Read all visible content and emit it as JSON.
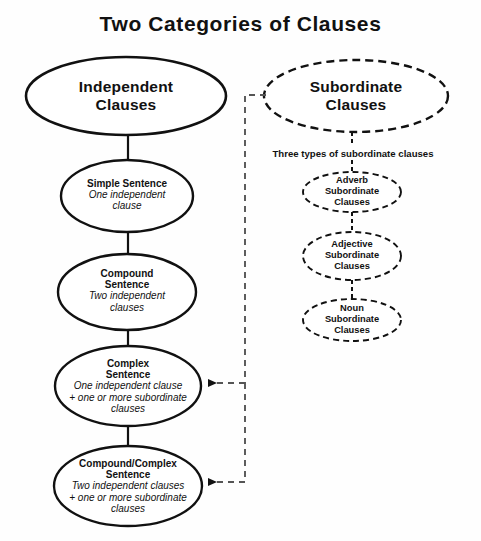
{
  "page": {
    "title": "Two Categories of Clauses",
    "background_color": "#fefefe",
    "line_color": "#111111"
  },
  "left_branch": {
    "root": {
      "head_line1": "Independent",
      "head_line2": "Clauses",
      "border_style": "solid"
    },
    "nodes": [
      {
        "head_line1": "Simple Sentence",
        "head_line2": "",
        "detail_line1": "One independent",
        "detail_line2": "clause",
        "detail_line3": "",
        "border_style": "solid"
      },
      {
        "head_line1": "Compound",
        "head_line2": "Sentence",
        "detail_line1": "Two independent",
        "detail_line2": "clauses",
        "detail_line3": "",
        "border_style": "solid"
      },
      {
        "head_line1": "Complex",
        "head_line2": "Sentence",
        "detail_line1": "One independent clause",
        "detail_line2": "+ one or more subordinate",
        "detail_line3": "clauses",
        "border_style": "solid"
      },
      {
        "head_line1": "Compound/Complex",
        "head_line2": "Sentence",
        "detail_line1": "Two independent clauses",
        "detail_line2": "+ one or more subordinate",
        "detail_line3": "clauses",
        "border_style": "solid"
      }
    ]
  },
  "right_branch": {
    "root": {
      "head_line1": "Subordinate",
      "head_line2": "Clauses",
      "border_style": "dashed"
    },
    "caption": "Three types of subordinate clauses",
    "nodes": [
      {
        "head_line1": "Adverb",
        "head_line2": "Subordinate",
        "head_line3": "Clauses",
        "border_style": "dashed"
      },
      {
        "head_line1": "Adjective",
        "head_line2": "Subordinate",
        "head_line3": "Clauses",
        "border_style": "dashed"
      },
      {
        "head_line1": "Noun",
        "head_line2": "Subordinate",
        "head_line3": "Clauses",
        "border_style": "dashed"
      }
    ]
  },
  "connections": {
    "cross_links": [
      {
        "from": "Subordinate Clauses",
        "to": "Complex Sentence",
        "style": "dashed-arrow"
      },
      {
        "from": "Subordinate Clauses",
        "to": "Compound/Complex Sentence",
        "style": "dashed-arrow"
      }
    ]
  }
}
